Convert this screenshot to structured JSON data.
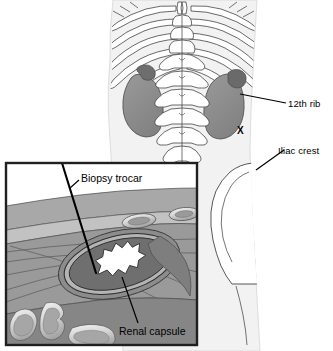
{
  "figure": {
    "background_color": "#ffffff"
  },
  "overview": {
    "description": "Posterior view of lower thorax, lumbar spine, ribs, kidneys and iliac crest",
    "biopsy_site_marker": "X",
    "labels": [
      {
        "name": "12th rib",
        "text": "12th rib"
      },
      {
        "name": "Iliac crest",
        "text": "Iliac crest"
      }
    ]
  },
  "inset": {
    "description": "Cross-sectional view of needle path through skin, muscle layers, perirenal fat and renal capsule",
    "labels": [
      {
        "name": "Biopsy trocar",
        "text": "Biopsy trocar"
      },
      {
        "name": "Renal capsule",
        "text": "Renal capsule"
      }
    ]
  },
  "colors": {
    "outline": "#231f20",
    "body_tint": "#f0f0f0",
    "bone_fill": "#ffffff",
    "kidney_fill": "#8e8e8e",
    "adrenal_fill": "#6e6e6e",
    "skin_layer": "#a8a8a8",
    "fat_layer": "#c2c2c2",
    "muscle_layer": "#909090",
    "deep_muscle": "#7c7c7c",
    "capsule_fill": "#6f6f6f",
    "medulla_fill": "#ffffff",
    "bowel_rim": "#e8e8e8",
    "bowel_fill": "#b0b0b0",
    "needle": "#000000",
    "inset_border": "#231f20"
  }
}
